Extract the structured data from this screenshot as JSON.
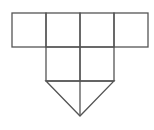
{
  "diagram": {
    "type": "geometric-net",
    "stroke_color": "#555555",
    "background": "#ffffff",
    "stroke_width": 1.3,
    "top_row": {
      "x": 12,
      "y": 13,
      "cell_width": 34,
      "cell_height": 34,
      "cells": 4
    },
    "middle_block": {
      "x": 46,
      "y": 47,
      "cell_width": 34,
      "cell_height": 34,
      "cells": 2
    },
    "triangle": {
      "points": [
        [
          46,
          81
        ],
        [
          80,
          116
        ],
        [
          114,
          81
        ]
      ],
      "center_line": [
        [
          80,
          81
        ],
        [
          80,
          116
        ]
      ]
    }
  }
}
